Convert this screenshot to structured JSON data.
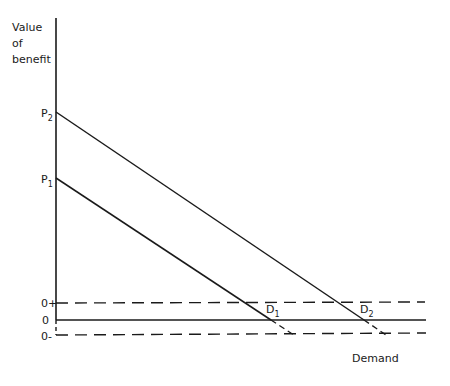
{
  "diagram": {
    "y_axis_label": [
      "Value",
      "of",
      "benefit"
    ],
    "x_axis_label": "Demand",
    "price_labels": [
      {
        "main": "P",
        "sub": "2"
      },
      {
        "main": "P",
        "sub": "1"
      }
    ],
    "baseline_labels": {
      "plus": "0+",
      "zero": "0",
      "minus": "0-"
    },
    "demand_labels": [
      {
        "main": "D",
        "sub": "1"
      },
      {
        "main": "D",
        "sub": "2"
      }
    ],
    "line_color": "#1a1a1a"
  }
}
